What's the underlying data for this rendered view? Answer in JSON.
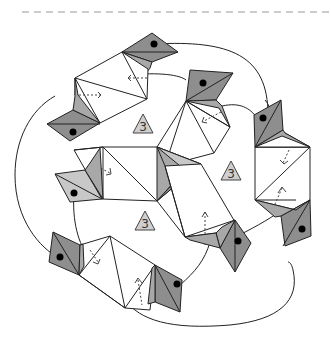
{
  "diagram": {
    "title": "",
    "separator": {
      "style": "dashed",
      "y": 12,
      "color": "#9a9a9a"
    },
    "badges": [
      {
        "label": "3",
        "x": 143,
        "y": 126
      },
      {
        "label": "3",
        "x": 231,
        "y": 173
      },
      {
        "label": "3",
        "x": 145,
        "y": 223
      }
    ],
    "colors": {
      "dark": "#8e8e8e",
      "medium": "#a8a8a8",
      "light": "#c8c8c8",
      "stroke": "#222222"
    }
  }
}
